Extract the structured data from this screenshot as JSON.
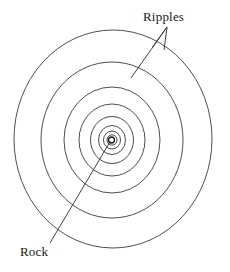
{
  "diagram": {
    "type": "concentric-spiral-waves",
    "background_color": "#ffffff",
    "stroke_color": "#3a3a3a",
    "text_color": "#1a1a1a",
    "center": {
      "x": 111,
      "y": 140
    },
    "labels": {
      "ripples": "Ripples",
      "rock": "Rock"
    },
    "annotations": [
      {
        "name": "ripples-leader",
        "label": "Ripples",
        "arrow_head": {
          "x": 167,
          "y": 27
        },
        "tail": {
          "x": 131,
          "y": 78
        },
        "has_arrowhead": true
      },
      {
        "name": "rock-leader",
        "label": "Rock",
        "arrow_head": {
          "x": 111,
          "y": 141
        },
        "tail": {
          "x": 50,
          "y": 243
        },
        "has_arrowhead": false
      }
    ],
    "rings": [
      {
        "name": "ring-outer-1",
        "rx": 99,
        "ry": 109
      },
      {
        "name": "ring-outer-2",
        "rx": 71,
        "ry": 78
      },
      {
        "name": "ring-outer-3",
        "rx": 48,
        "ry": 53
      },
      {
        "name": "ring-mid-1",
        "rx": 33,
        "ry": 36
      },
      {
        "name": "ring-mid-2",
        "rx": 21,
        "ry": 23
      },
      {
        "name": "ring-mid-3",
        "rx": 13,
        "ry": 14
      },
      {
        "name": "ring-inner-1",
        "rx": 8,
        "ry": 9
      },
      {
        "name": "ring-inner-2",
        "rx": 5,
        "ry": 5
      },
      {
        "name": "ring-rock",
        "rx": 3,
        "ry": 3
      }
    ]
  }
}
